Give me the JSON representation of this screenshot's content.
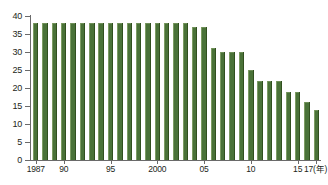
{
  "chart_data": {
    "type": "bar",
    "title": "",
    "subtitle": "",
    "xlabel": "年",
    "ylabel": "",
    "ylim": [
      0,
      40
    ],
    "ytick_step": 5,
    "grid": false,
    "legend": null,
    "bar_color": "#4a7238",
    "axis_color": "#6a6a6a",
    "text_color": "#231f20",
    "background": "#ffffff",
    "categories": [
      "1987",
      "1988",
      "1989",
      "1990",
      "1991",
      "1992",
      "1993",
      "1994",
      "1995",
      "1996",
      "1997",
      "1998",
      "1999",
      "2000",
      "2001",
      "2002",
      "2003",
      "2004",
      "2005",
      "2006",
      "2007",
      "2008",
      "2009",
      "2010",
      "2011",
      "2012",
      "2013",
      "2014",
      "2015",
      "2016",
      "2017"
    ],
    "values": [
      38,
      38,
      38,
      38,
      38,
      38,
      38,
      38,
      38,
      38,
      38,
      38,
      38,
      38,
      38,
      38,
      38,
      37,
      37,
      31,
      30,
      30,
      30,
      25,
      22,
      22,
      22,
      19,
      19,
      16,
      14
    ],
    "y_ticks": [
      0,
      5,
      10,
      15,
      20,
      25,
      30,
      35,
      40
    ],
    "y_tick_labels": [
      "0",
      "5",
      "10",
      "15",
      "20",
      "25",
      "30",
      "35",
      "40"
    ],
    "x_tick_labels": [
      {
        "label": "1987",
        "index": 0
      },
      {
        "label": "90",
        "index": 3
      },
      {
        "label": "95",
        "index": 8
      },
      {
        "label": "2000",
        "index": 13
      },
      {
        "label": "05",
        "index": 18
      },
      {
        "label": "10",
        "index": 23
      },
      {
        "label": "15",
        "index": 28
      },
      {
        "label": "17(年)",
        "index": 30
      }
    ]
  }
}
